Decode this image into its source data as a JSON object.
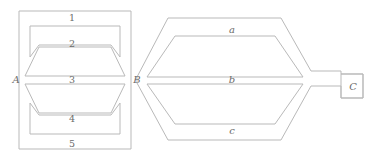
{
  "figure": {
    "stroke_color": "#b9b9b9",
    "text_color": "#6b6b6b",
    "background_color": "#ffffff",
    "nodes": [
      {
        "id": "A",
        "label": "A",
        "x": 16,
        "y": 80
      },
      {
        "id": "B",
        "label": "B",
        "x": 137,
        "y": 80
      },
      {
        "id": "C",
        "label": "C",
        "x": 357,
        "y": 88
      }
    ],
    "left_block": {
      "name": "region-A-B",
      "outline": "19,11 131,11 131,149 19,149",
      "regions": [
        {
          "id": "1",
          "label": "1",
          "label_x": 72,
          "label_y": 18
        },
        {
          "id": "2",
          "label": "2",
          "label_x": 72,
          "label_y": 44
        },
        {
          "id": "3",
          "label": "3",
          "label_x": 72,
          "label_y": 80
        },
        {
          "id": "4",
          "label": "4",
          "label_x": 72,
          "label_y": 119
        },
        {
          "id": "5",
          "label": "5",
          "label_x": 72,
          "label_y": 144
        }
      ]
    },
    "right_block": {
      "name": "region-B-C",
      "regions": [
        {
          "id": "a",
          "label": "a",
          "label_x": 232,
          "label_y": 30
        },
        {
          "id": "b",
          "label": "b",
          "label_x": 232,
          "label_y": 80
        },
        {
          "id": "c",
          "label": "c",
          "label_x": 232,
          "label_y": 131
        }
      ],
      "terminal": {
        "id": "C",
        "label": "C",
        "x": 341,
        "y": 74,
        "w": 22,
        "h": 24
      }
    }
  }
}
